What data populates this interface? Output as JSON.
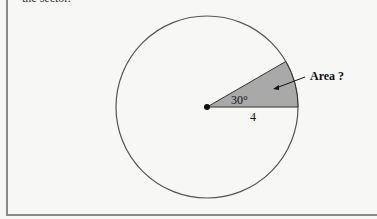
{
  "caption": "the sector.",
  "diagram": {
    "angle_label": "30°",
    "radius_label": "4",
    "area_label": "Area ?",
    "colors": {
      "sector_fill": "#a9a9a9",
      "circle_stroke": "#555555",
      "background": "#f7f7f5"
    }
  }
}
